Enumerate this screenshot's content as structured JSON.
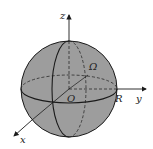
{
  "diagram": {
    "type": "sphere-coordinate-system",
    "labels": {
      "z_axis": "z",
      "y_axis": "y",
      "x_axis": "x",
      "origin": "O",
      "radius": "R",
      "region": "Ω"
    },
    "colors": {
      "sphere_fill": "#9d9d9d",
      "stroke": "#1a1a1a",
      "background": "#ffffff"
    }
  }
}
